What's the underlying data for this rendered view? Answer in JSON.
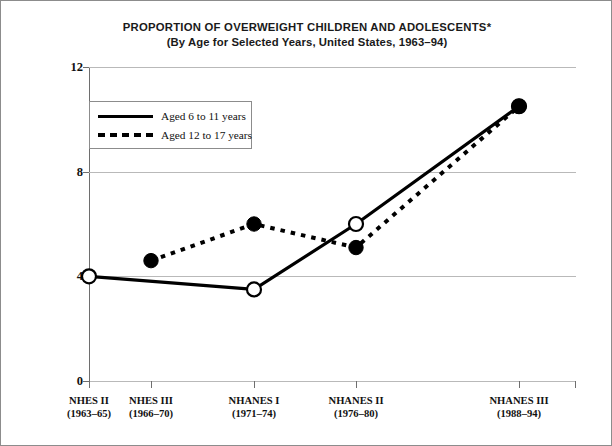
{
  "figure": {
    "title_line1": "PROPORTION OF OVERWEIGHT CHILDREN AND ADOLESCENTS",
    "title_asterisk": "*",
    "title_line2": "(By Age for Selected Years, United States, 1963–94)"
  },
  "legend": {
    "position": "inside-top-left",
    "items": [
      {
        "label": "Aged 6 to 11 years",
        "style": "solid",
        "marker": "open-circle"
      },
      {
        "label": "Aged 12 to 17 years",
        "style": "dotted",
        "marker": "filled-circle"
      }
    ]
  },
  "axes": {
    "ylabel": "Percent",
    "yticks": [
      "0",
      "4",
      "8",
      "12"
    ],
    "ymin": 0,
    "ymax": 12,
    "xlabel": ""
  },
  "chart_data": {
    "type": "line",
    "title": "PROPORTION OF OVERWEIGHT CHILDREN AND ADOLESCENTS*",
    "subtitle": "(By Age for Selected Years, United States, 1963–94)",
    "xlabel": "",
    "ylabel": "Percent",
    "ylim": [
      0,
      12
    ],
    "yticks": [
      0,
      4,
      8,
      12
    ],
    "grid": true,
    "legend_position": "upper left inside",
    "categories": [
      "NHES II",
      "NHES III",
      "NHANES I",
      "NHANES II",
      "NHANES III"
    ],
    "category_years": [
      "(1963–65)",
      "(1966–70)",
      "(1971–74)",
      "(1976–80)",
      "(1988–94)"
    ],
    "series": [
      {
        "name": "Aged 6 to 11 years",
        "style": "solid",
        "marker": "open-circle",
        "values": [
          4.0,
          null,
          3.5,
          6.0,
          10.5
        ]
      },
      {
        "name": "Aged 12 to 17 years",
        "style": "dotted",
        "marker": "filled-circle",
        "values": [
          null,
          4.6,
          6.0,
          5.1,
          10.5
        ]
      }
    ]
  },
  "xcats": [
    {
      "name": "NHES II",
      "years": "(1963–65)"
    },
    {
      "name": "NHES III",
      "years": "(1966–70)"
    },
    {
      "name": "NHANES I",
      "years": "(1971–74)"
    },
    {
      "name": "NHANES II",
      "years": "(1976–80)"
    },
    {
      "name": "NHANES III",
      "years": "(1988–94)"
    }
  ],
  "colors": {
    "line": "#000000",
    "grid": "#b9b9b9",
    "axis": "#6e6e6e",
    "text": "#111111",
    "background": "#ffffff"
  }
}
